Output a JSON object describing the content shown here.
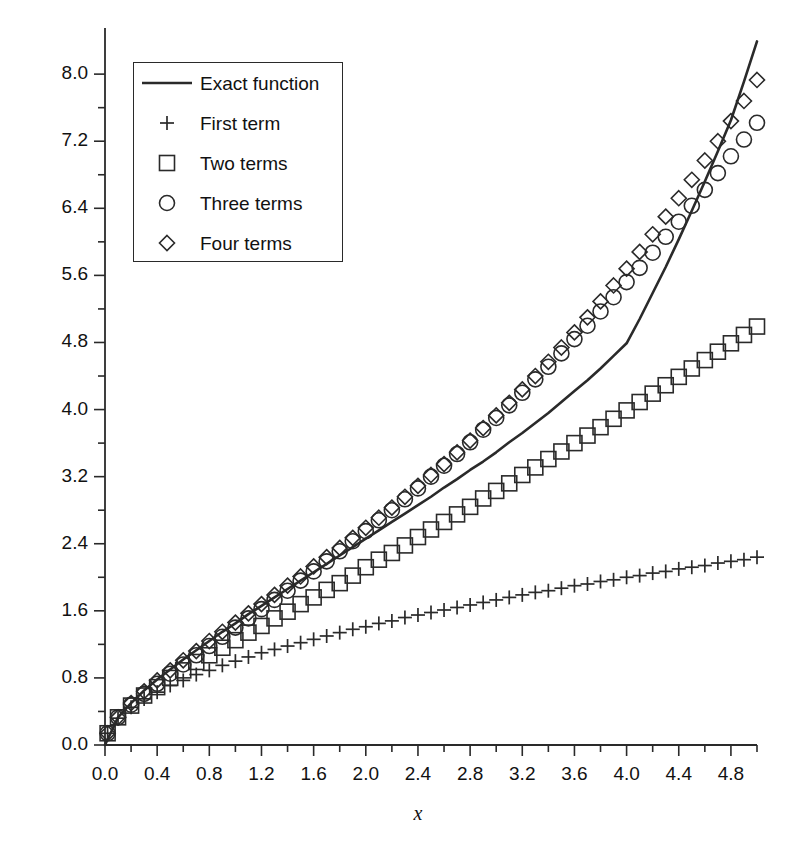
{
  "chart_data": {
    "type": "line",
    "title": "",
    "xlabel": "x",
    "ylabel": "",
    "xlim": [
      0.0,
      5.0
    ],
    "ylim": [
      0.0,
      8.55
    ],
    "grid": false,
    "legend_position": "top-left",
    "x_ticks": [
      "0.0",
      "0.4",
      "0.8",
      "1.2",
      "1.6",
      "2.0",
      "2.4",
      "2.8",
      "3.2",
      "3.6",
      "4.0",
      "4.4",
      "4.8"
    ],
    "x_tick_values": [
      0.0,
      0.4,
      0.8,
      1.2,
      1.6,
      2.0,
      2.4,
      2.8,
      3.2,
      3.6,
      4.0,
      4.4,
      4.8
    ],
    "x_minor_step": 0.2,
    "y_ticks": [
      "0.0",
      "0.8",
      "1.6",
      "2.4",
      "3.2",
      "4.0",
      "4.8",
      "5.6",
      "6.4",
      "7.2",
      "8.0"
    ],
    "y_tick_values": [
      0.0,
      0.8,
      1.6,
      2.4,
      3.2,
      4.0,
      4.8,
      5.6,
      6.4,
      7.2,
      8.0
    ],
    "y_minor_step": 0.4,
    "series": [
      {
        "name": "Exact function",
        "marker": "line",
        "style": "solid-line",
        "x": [
          0.0,
          0.1,
          0.2,
          0.3,
          0.4,
          0.5,
          0.6,
          0.7,
          0.8,
          0.9,
          1.0,
          1.1,
          1.2,
          1.3,
          1.4,
          1.5,
          1.6,
          1.7,
          1.8,
          1.9,
          2.0,
          2.1,
          2.2,
          2.3,
          2.4,
          2.5,
          2.6,
          2.7,
          2.8,
          2.9,
          3.0,
          3.1,
          3.2,
          3.3,
          3.4,
          3.5,
          3.6,
          3.7,
          3.8,
          3.9,
          4.0,
          4.1,
          4.2,
          4.3,
          4.4,
          4.5,
          4.6,
          4.7,
          4.8,
          4.9,
          5.0
        ],
        "values": [
          0.0,
          0.33,
          0.5,
          0.65,
          0.78,
          0.9,
          1.02,
          1.13,
          1.24,
          1.35,
          1.45,
          1.56,
          1.66,
          1.76,
          1.86,
          1.96,
          2.06,
          2.16,
          2.26,
          2.36,
          2.46,
          2.56,
          2.66,
          2.76,
          2.86,
          2.96,
          3.07,
          3.17,
          3.28,
          3.38,
          3.49,
          3.61,
          3.72,
          3.84,
          3.96,
          4.09,
          4.22,
          4.35,
          4.49,
          4.64,
          4.79,
          5.08,
          5.39,
          5.7,
          6.03,
          6.37,
          6.72,
          7.08,
          7.45,
          7.91,
          8.39
        ]
      },
      {
        "name": "First term",
        "marker": "plus",
        "x": [
          0.02,
          0.1,
          0.2,
          0.3,
          0.4,
          0.5,
          0.6,
          0.7,
          0.8,
          0.9,
          1.0,
          1.1,
          1.2,
          1.3,
          1.4,
          1.5,
          1.6,
          1.7,
          1.8,
          1.9,
          2.0,
          2.1,
          2.2,
          2.3,
          2.4,
          2.5,
          2.6,
          2.7,
          2.8,
          2.9,
          3.0,
          3.1,
          3.2,
          3.3,
          3.4,
          3.5,
          3.6,
          3.7,
          3.8,
          3.9,
          4.0,
          4.1,
          4.2,
          4.3,
          4.4,
          4.5,
          4.6,
          4.7,
          4.8,
          4.9,
          5.0
        ],
        "values": [
          0.14,
          0.32,
          0.45,
          0.55,
          0.63,
          0.71,
          0.77,
          0.84,
          0.89,
          0.95,
          1.0,
          1.05,
          1.1,
          1.14,
          1.18,
          1.22,
          1.26,
          1.3,
          1.34,
          1.38,
          1.41,
          1.45,
          1.48,
          1.52,
          1.55,
          1.58,
          1.61,
          1.64,
          1.67,
          1.7,
          1.73,
          1.76,
          1.79,
          1.82,
          1.84,
          1.87,
          1.9,
          1.92,
          1.95,
          1.97,
          2.0,
          2.02,
          2.05,
          2.07,
          2.1,
          2.12,
          2.14,
          2.17,
          2.19,
          2.21,
          2.24
        ]
      },
      {
        "name": "Two terms",
        "marker": "square",
        "x": [
          0.02,
          0.1,
          0.2,
          0.3,
          0.4,
          0.5,
          0.6,
          0.7,
          0.8,
          0.9,
          1.0,
          1.1,
          1.2,
          1.3,
          1.4,
          1.5,
          1.6,
          1.7,
          1.8,
          1.9,
          2.0,
          2.1,
          2.2,
          2.3,
          2.4,
          2.5,
          2.6,
          2.7,
          2.8,
          2.9,
          3.0,
          3.1,
          3.2,
          3.3,
          3.4,
          3.5,
          3.6,
          3.7,
          3.8,
          3.9,
          4.0,
          4.1,
          4.2,
          4.3,
          4.4,
          4.5,
          4.6,
          4.7,
          4.8,
          4.9,
          5.0
        ],
        "values": [
          0.14,
          0.33,
          0.47,
          0.59,
          0.69,
          0.8,
          0.89,
          0.99,
          1.07,
          1.16,
          1.25,
          1.34,
          1.42,
          1.51,
          1.59,
          1.68,
          1.76,
          1.85,
          1.93,
          2.02,
          2.12,
          2.21,
          2.29,
          2.38,
          2.48,
          2.57,
          2.66,
          2.75,
          2.84,
          2.94,
          3.03,
          3.12,
          3.22,
          3.31,
          3.41,
          3.5,
          3.6,
          3.69,
          3.79,
          3.89,
          3.99,
          4.09,
          4.19,
          4.29,
          4.39,
          4.49,
          4.59,
          4.69,
          4.79,
          4.89,
          4.99
        ]
      },
      {
        "name": "Three terms",
        "marker": "circle",
        "x": [
          0.02,
          0.1,
          0.2,
          0.3,
          0.4,
          0.5,
          0.6,
          0.7,
          0.8,
          0.9,
          1.0,
          1.1,
          1.2,
          1.3,
          1.4,
          1.5,
          1.6,
          1.7,
          1.8,
          1.9,
          2.0,
          2.1,
          2.2,
          2.3,
          2.4,
          2.5,
          2.6,
          2.7,
          2.8,
          2.9,
          3.0,
          3.1,
          3.2,
          3.3,
          3.4,
          3.5,
          3.6,
          3.7,
          3.8,
          3.9,
          4.0,
          4.1,
          4.2,
          4.3,
          4.4,
          4.5,
          4.6,
          4.7,
          4.8,
          4.9,
          5.0
        ],
        "values": [
          0.14,
          0.33,
          0.48,
          0.61,
          0.73,
          0.85,
          0.96,
          1.07,
          1.18,
          1.29,
          1.4,
          1.51,
          1.62,
          1.73,
          1.84,
          1.96,
          2.07,
          2.19,
          2.31,
          2.43,
          2.55,
          2.68,
          2.8,
          2.93,
          3.06,
          3.2,
          3.33,
          3.47,
          3.61,
          3.76,
          3.9,
          4.05,
          4.2,
          4.36,
          4.51,
          4.67,
          4.84,
          5.0,
          5.17,
          5.34,
          5.52,
          5.69,
          5.87,
          6.06,
          6.24,
          6.43,
          6.62,
          6.82,
          7.02,
          7.22,
          7.42
        ]
      },
      {
        "name": "Four terms",
        "marker": "diamond",
        "x": [
          0.02,
          0.1,
          0.2,
          0.3,
          0.4,
          0.5,
          0.6,
          0.7,
          0.8,
          0.9,
          1.0,
          1.1,
          1.2,
          1.3,
          1.4,
          1.5,
          1.6,
          1.7,
          1.8,
          1.9,
          2.0,
          2.1,
          2.2,
          2.3,
          2.4,
          2.5,
          2.6,
          2.7,
          2.8,
          2.9,
          3.0,
          3.1,
          3.2,
          3.3,
          3.4,
          3.5,
          3.6,
          3.7,
          3.8,
          3.9,
          4.0,
          4.1,
          4.2,
          4.3,
          4.4,
          4.5,
          4.6,
          4.7,
          4.8,
          4.9,
          5.0
        ],
        "values": [
          0.14,
          0.33,
          0.5,
          0.64,
          0.77,
          0.89,
          1.01,
          1.12,
          1.24,
          1.35,
          1.46,
          1.57,
          1.68,
          1.79,
          1.9,
          2.01,
          2.13,
          2.24,
          2.35,
          2.47,
          2.59,
          2.71,
          2.83,
          2.96,
          3.09,
          3.22,
          3.35,
          3.49,
          3.63,
          3.78,
          3.93,
          4.08,
          4.24,
          4.4,
          4.57,
          4.74,
          4.92,
          5.1,
          5.29,
          5.48,
          5.68,
          5.88,
          6.09,
          6.3,
          6.52,
          6.74,
          6.97,
          7.2,
          7.44,
          7.68,
          7.93
        ]
      }
    ]
  },
  "legend": {
    "entries": [
      {
        "label": "Exact function",
        "marker": "line"
      },
      {
        "label": "First term",
        "marker": "plus"
      },
      {
        "label": "Two terms",
        "marker": "square"
      },
      {
        "label": "Three terms",
        "marker": "circle"
      },
      {
        "label": "Four terms",
        "marker": "diamond"
      }
    ]
  },
  "axis": {
    "x_title": "x"
  },
  "colors": {
    "ink": "#2a2a2a",
    "text": "#111111",
    "background": "#ffffff"
  }
}
